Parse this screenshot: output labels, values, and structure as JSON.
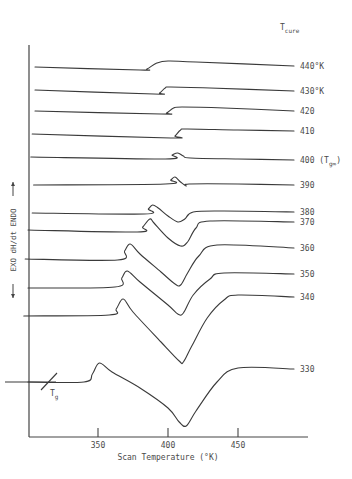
{
  "chart_data": {
    "type": "line",
    "title": "",
    "xlabel": "Scan Temperature (°K)",
    "ylabel": "EXO  dH/dt  ENDO",
    "ylabel_arrows": {
      "down": "EXO",
      "up": "ENDO"
    },
    "xlim": [
      300,
      490
    ],
    "x_ticks": [
      350,
      400,
      450
    ],
    "x_tick_labels": [
      "350",
      "400",
      "450"
    ],
    "grid": false,
    "legend_header": {
      "main": "T",
      "sub": "cure"
    },
    "signal_units": "arbitrary (offset per curve, endo up)",
    "series": [
      {
        "name": "440°K",
        "label": "440°K",
        "offset": 0,
        "points": [
          [
            305,
            0
          ],
          [
            380,
            -3
          ],
          [
            385,
            -2
          ],
          [
            392,
            4
          ],
          [
            400,
            6
          ],
          [
            420,
            5
          ],
          [
            490,
            1
          ]
        ]
      },
      {
        "name": "430°K",
        "label": "430°K",
        "offset": -23,
        "points": [
          [
            305,
            0
          ],
          [
            390,
            -4
          ],
          [
            394,
            -3
          ],
          [
            398,
            2
          ],
          [
            402,
            3
          ],
          [
            430,
            2
          ],
          [
            490,
            -1
          ]
        ]
      },
      {
        "name": "420",
        "label": "420",
        "offset": -44,
        "points": [
          [
            305,
            0
          ],
          [
            395,
            -3
          ],
          [
            399,
            -2
          ],
          [
            404,
            3
          ],
          [
            410,
            4
          ],
          [
            440,
            3
          ],
          [
            490,
            0
          ]
        ]
      },
      {
        "name": "410",
        "label": "410",
        "offset": -67,
        "points": [
          [
            303,
            0
          ],
          [
            402,
            -4
          ],
          [
            405,
            -2
          ],
          [
            409,
            4
          ],
          [
            414,
            5
          ],
          [
            450,
            4
          ],
          [
            490,
            3
          ]
        ]
      },
      {
        "name": "400",
        "label": "400",
        "label_suffix": "(T",
        "label_suffix_sub": "g∞",
        "label_suffix_end": ")",
        "offset": -90,
        "points": [
          [
            302,
            0
          ],
          [
            398,
            -2
          ],
          [
            403,
            2
          ],
          [
            407,
            4
          ],
          [
            411,
            1
          ],
          [
            416,
            -1
          ],
          [
            450,
            -2
          ],
          [
            490,
            -3
          ]
        ]
      },
      {
        "name": "390",
        "label": "390",
        "offset": -118,
        "points": [
          [
            304,
            0
          ],
          [
            398,
            1
          ],
          [
            402,
            5
          ],
          [
            405,
            8
          ],
          [
            409,
            3
          ],
          [
            413,
            -1
          ],
          [
            415,
            1
          ],
          [
            450,
            1
          ],
          [
            490,
            0
          ]
        ]
      },
      {
        "name": "380",
        "label": "380",
        "offset": -146,
        "points": [
          [
            303,
            0
          ],
          [
            383,
            -1
          ],
          [
            386,
            4
          ],
          [
            389,
            8
          ],
          [
            393,
            5
          ],
          [
            400,
            -3
          ],
          [
            407,
            -9
          ],
          [
            412,
            -6
          ],
          [
            418,
            1
          ],
          [
            440,
            2
          ],
          [
            490,
            1
          ]
        ]
      },
      {
        "name": "370",
        "label": "370",
        "offset": -163,
        "points": [
          [
            300,
            0
          ],
          [
            378,
            -2
          ],
          [
            382,
            3
          ],
          [
            387,
            11
          ],
          [
            390,
            7
          ],
          [
            400,
            -8
          ],
          [
            409,
            -16
          ],
          [
            414,
            -12
          ],
          [
            420,
            2
          ],
          [
            430,
            9
          ],
          [
            490,
            8
          ]
        ]
      },
      {
        "name": "360",
        "label": "360",
        "offset": -192,
        "points": [
          [
            298,
            0
          ],
          [
            364,
            -1
          ],
          [
            369,
            8
          ],
          [
            373,
            15
          ],
          [
            380,
            5
          ],
          [
            395,
            -13
          ],
          [
            405,
            -25
          ],
          [
            409,
            -26
          ],
          [
            414,
            -14
          ],
          [
            422,
            3
          ],
          [
            435,
            14
          ],
          [
            490,
            11
          ]
        ]
      },
      {
        "name": "350",
        "label": "350",
        "offset": -221,
        "points": [
          [
            300,
            0
          ],
          [
            362,
            1
          ],
          [
            367,
            10
          ],
          [
            371,
            17
          ],
          [
            380,
            6
          ],
          [
            400,
            -17
          ],
          [
            407,
            -26
          ],
          [
            411,
            -25
          ],
          [
            418,
            -7
          ],
          [
            430,
            9
          ],
          [
            440,
            15
          ],
          [
            490,
            14
          ]
        ]
      },
      {
        "name": "340",
        "label": "340",
        "offset": -249,
        "points": [
          [
            297,
            0
          ],
          [
            358,
            1
          ],
          [
            363,
            7
          ],
          [
            368,
            17
          ],
          [
            375,
            4
          ],
          [
            395,
            -26
          ],
          [
            408,
            -45
          ],
          [
            411,
            -46
          ],
          [
            417,
            -30
          ],
          [
            428,
            -2
          ],
          [
            440,
            16
          ],
          [
            450,
            21
          ],
          [
            490,
            19
          ]
        ]
      },
      {
        "name": "330",
        "label": "330",
        "offset": -315,
        "points": [
          [
            300,
            0
          ],
          [
            340,
            0
          ],
          [
            346,
            8
          ],
          [
            351,
            19
          ],
          [
            360,
            10
          ],
          [
            380,
            -6
          ],
          [
            400,
            -26
          ],
          [
            408,
            -40
          ],
          [
            413,
            -44
          ],
          [
            420,
            -29
          ],
          [
            435,
            0
          ],
          [
            450,
            14
          ],
          [
            490,
            13
          ]
        ]
      }
    ],
    "annotations": [
      {
        "text": "T",
        "sub": "g",
        "at_series": "330",
        "x": 342,
        "note": "tangent intersection marking Tg"
      }
    ]
  }
}
